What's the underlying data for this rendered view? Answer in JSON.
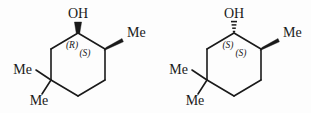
{
  "figure": {
    "background_color": "#fdfdfd",
    "line_color": "#1a1a1a",
    "structures": [
      {
        "id": "left",
        "hydroxyl_label": "OH",
        "hydroxyl_bond_style": "solid-wedge",
        "methyl_top_right_label": "Me",
        "methyl_top_right_bond_style": "solid-wedge",
        "methyl_left_label": "Me",
        "methyl_left_bond_style": "plain",
        "methyl_bottom_label": "Me",
        "methyl_bottom_bond_style": "plain",
        "stereo_c1": "(R)",
        "stereo_c2": "(S)"
      },
      {
        "id": "right",
        "hydroxyl_label": "OH",
        "hydroxyl_bond_style": "hashed-wedge",
        "methyl_top_right_label": "Me",
        "methyl_top_right_bond_style": "solid-wedge",
        "methyl_left_label": "Me",
        "methyl_left_bond_style": "plain",
        "methyl_bottom_label": "Me",
        "methyl_bottom_bond_style": "plain",
        "stereo_c1": "(S)",
        "stereo_c2": "(S)"
      }
    ]
  }
}
